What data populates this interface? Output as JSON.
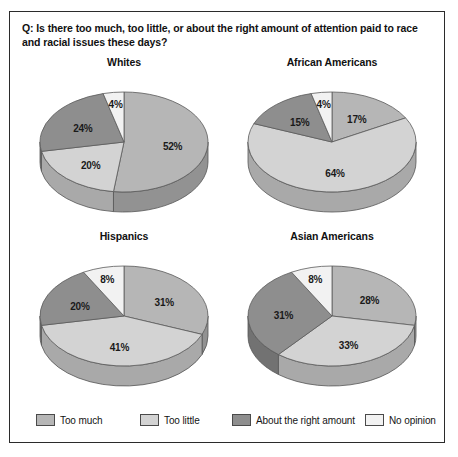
{
  "question": "Q: Is there too much, too little, or about the right amount of attention paid to race and racial issues these days?",
  "legend": {
    "items": [
      {
        "label": "Too much",
        "color": "#b6b6b6"
      },
      {
        "label": "Too little",
        "color": "#d3d3d3"
      },
      {
        "label": "About the right amount",
        "color": "#8e8e8e"
      },
      {
        "label": "No opinion",
        "color": "#f2f2f2"
      }
    ]
  },
  "chart_data": {
    "type": "pie",
    "title": "Q: Is there too much, too little, or about the right amount of attention paid to race and racial issues these days?",
    "categories": [
      "Too much",
      "Too little",
      "About the right amount",
      "No opinion"
    ],
    "colors": [
      "#b6b6b6",
      "#d3d3d3",
      "#8e8e8e",
      "#f2f2f2"
    ],
    "legend_position": "bottom",
    "grid": false,
    "units": "percent",
    "charts": [
      {
        "title": "Whites",
        "values": [
          52,
          20,
          24,
          4
        ],
        "labels": [
          "52%",
          "20%",
          "24%",
          "4%"
        ]
      },
      {
        "title": "African Americans",
        "values": [
          17,
          64,
          15,
          4
        ],
        "labels": [
          "17%",
          "64%",
          "15%",
          "4%"
        ]
      },
      {
        "title": "Hispanics",
        "values": [
          31,
          41,
          20,
          8
        ],
        "labels": [
          "31%",
          "41%",
          "20%",
          "8%"
        ]
      },
      {
        "title": "Asian Americans",
        "values": [
          28,
          33,
          31,
          8
        ],
        "labels": [
          "28%",
          "33%",
          "31%",
          "8%"
        ]
      }
    ]
  }
}
